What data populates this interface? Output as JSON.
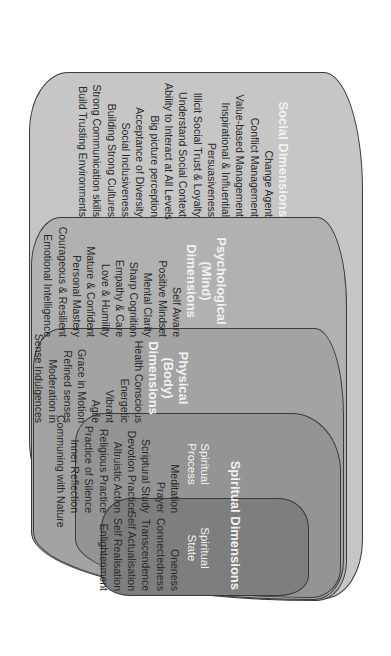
{
  "diagram": {
    "orientation": "rotated-90-clockwise",
    "colors": {
      "social_fill": "#c6c6c6",
      "psychological_fill": "#b1b1b1",
      "physical_fill": "#a3a3a3",
      "spiritual_fill": "#949494",
      "spiritual_state_fill": "#7e7e7e",
      "outline": "#3a3a3a",
      "heading_text": "#f2f2f2",
      "item_text": "#2a2a2a"
    },
    "social": {
      "title": "Social Dimensions",
      "items": [
        "Change Agent",
        "Conflict Management",
        "Value-based Management",
        "Inspirational & Influential",
        "Persuasiveness",
        "Illicit Social Trust & Loyalty",
        "Understand Social Context",
        "Ability to Interact at All Levels",
        "Big picture perception",
        "Acceptance of Diversity",
        "Social Inclusiveness",
        "Building Strong Cultures",
        "Strong Communication skills",
        "Build Trusting Environments"
      ]
    },
    "psychological": {
      "title_line1": "Psychological",
      "title_line2": "(Mind)",
      "title_line3": "Dimensions",
      "items": [
        "Self Aware",
        "Positive Mindset",
        "Mental Clarity",
        "Sharp Cognition",
        "Empathy & Care",
        "Love & Humility",
        "Mature & Confident",
        "Personal Mastery",
        "Courageous & Resilient",
        "Emotional Intelligence"
      ]
    },
    "physical": {
      "title_line1": "Physical",
      "title_line2": "(Body)",
      "title_line3": "Dimensions",
      "items": [
        "Health Conscious",
        "Energetic",
        "Vibrant",
        "Agile",
        "Grace in Motion",
        "Refined senses",
        "Moderation in",
        "Sense Indulgences"
      ]
    },
    "spiritual": {
      "title": "Spiritual Dimensions",
      "process": {
        "title_line1": "Spiritual",
        "title_line2": "Process",
        "items": [
          "Meditation",
          "Prayer",
          "Scriptural Study",
          "Devotion Practice",
          "Altruistic Action",
          "Religious Practice",
          "Practice of Silence",
          "Inner Reflection",
          "Communing with Nature"
        ]
      },
      "state": {
        "title_line1": "Spiritual",
        "title_line2": "State",
        "items": [
          "Oneness",
          "Connectedness",
          "Transcendence",
          "Self Actualisation",
          "Self Realisation",
          "Enlightenment"
        ]
      }
    }
  }
}
